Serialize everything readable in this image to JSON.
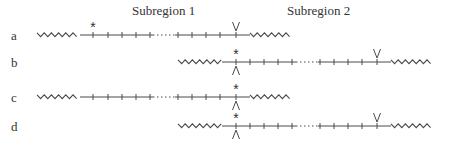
{
  "headings": {
    "subregion1": "Subregion 1",
    "subregion2": "Subregion 2"
  },
  "rows": [
    {
      "label": "a",
      "y": 35,
      "left_zigzag": [
        37,
        80
      ],
      "segments": [
        [
          80,
          153
        ],
        [
          175,
          250
        ]
      ],
      "dotted": [
        153,
        175
      ],
      "right_zigzag": [
        250,
        292
      ],
      "ticks": [
        93,
        108,
        122,
        136,
        150,
        178,
        192,
        206,
        220,
        236
      ],
      "markers": [
        {
          "type": "asterisk",
          "x": 93,
          "pos": "above"
        },
        {
          "type": "V",
          "x": 236,
          "pos": "above"
        }
      ]
    },
    {
      "label": "b",
      "y": 62,
      "left_zigzag": [
        178,
        222
      ],
      "segments": [
        [
          222,
          296
        ],
        [
          318,
          391
        ]
      ],
      "dotted": [
        296,
        318
      ],
      "right_zigzag": [
        391,
        433
      ],
      "ticks": [
        236,
        250,
        264,
        278,
        292,
        320,
        334,
        348,
        362,
        377
      ],
      "markers": [
        {
          "type": "asterisk",
          "x": 236,
          "pos": "above"
        },
        {
          "type": "Λ",
          "x": 236,
          "pos": "below"
        },
        {
          "type": "V",
          "x": 377,
          "pos": "above"
        }
      ]
    },
    {
      "label": "c",
      "y": 97,
      "left_zigzag": [
        37,
        80
      ],
      "segments": [
        [
          80,
          153
        ],
        [
          175,
          250
        ]
      ],
      "dotted": [
        153,
        175
      ],
      "right_zigzag": [
        250,
        292
      ],
      "ticks": [
        93,
        108,
        122,
        136,
        150,
        178,
        192,
        206,
        220,
        236
      ],
      "markers": [
        {
          "type": "asterisk",
          "x": 236,
          "pos": "above"
        },
        {
          "type": "Λ",
          "x": 236,
          "pos": "below"
        }
      ]
    },
    {
      "label": "d",
      "y": 126,
      "left_zigzag": [
        178,
        222
      ],
      "segments": [
        [
          222,
          296
        ],
        [
          318,
          391
        ]
      ],
      "dotted": [
        296,
        318
      ],
      "right_zigzag": [
        391,
        433
      ],
      "ticks": [
        236,
        250,
        264,
        278,
        292,
        320,
        334,
        348,
        362,
        377
      ],
      "markers": [
        {
          "type": "asterisk",
          "x": 236,
          "pos": "above"
        },
        {
          "type": "Λ",
          "x": 236,
          "pos": "below"
        },
        {
          "type": "V",
          "x": 377,
          "pos": "above"
        }
      ]
    }
  ],
  "colors": {
    "line": "#4a4a4a",
    "text": "#333333"
  }
}
